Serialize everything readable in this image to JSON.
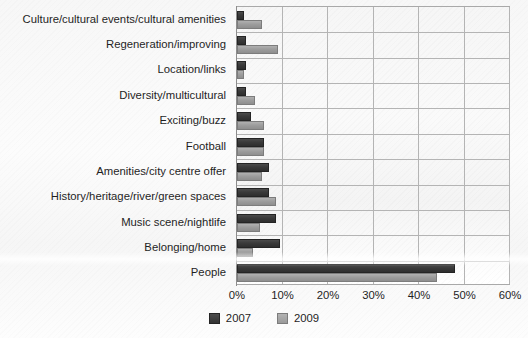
{
  "chart_data": {
    "type": "bar",
    "orientation": "horizontal",
    "title": "",
    "xlabel": "",
    "ylabel": "",
    "xlim": [
      0,
      60
    ],
    "xticks": [
      "0%",
      "10%",
      "20%",
      "30%",
      "40%",
      "50%",
      "60%"
    ],
    "xtick_values": [
      0,
      10,
      20,
      30,
      40,
      50,
      60
    ],
    "grid": true,
    "legend_position": "bottom-center",
    "categories": [
      "Culture/cultural events/cultural amenities",
      "Regeneration/improving",
      "Location/links",
      "Diversity/multicultural",
      "Exciting/buzz",
      "Football",
      "Amenities/city centre offer",
      "History/heritage/river/green spaces",
      "Music scene/nightlife",
      "Belonging/home",
      "People"
    ],
    "series": [
      {
        "name": "2007",
        "color": "#3a3a3a",
        "values": [
          1.5,
          2,
          2,
          2,
          3,
          6,
          7,
          7,
          8.5,
          9.5,
          48
        ]
      },
      {
        "name": "2009",
        "color": "#9d9d9d",
        "values": [
          5.5,
          9,
          1.5,
          4,
          6,
          6,
          5.5,
          8.5,
          5,
          3.5,
          44
        ]
      }
    ]
  },
  "legend": {
    "items": [
      {
        "label": "2007",
        "swatch": "legend-swatch-2007"
      },
      {
        "label": "2009",
        "swatch": "legend-swatch-2009"
      }
    ]
  }
}
